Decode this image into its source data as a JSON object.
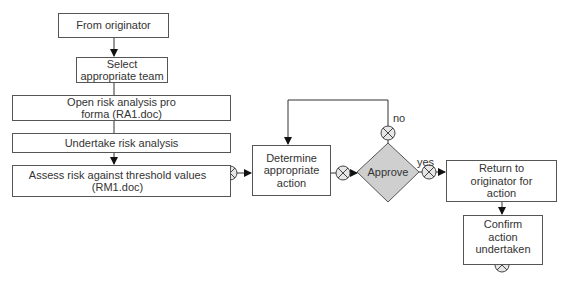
{
  "nodes": {
    "from_originator": "From originator",
    "select_team": "Select appropriate team",
    "open_risk": "Open risk analysis pro forma (RA1.doc)",
    "undertake": "Undertake risk analysis",
    "assess": "Assess risk against threshold values (RM1.doc)",
    "determine": "Determine appropriate action",
    "approve": "Approve",
    "return": "Return to originator for action",
    "confirm": "Confirm action undertaken"
  },
  "labels": {
    "no": "no",
    "yes": "yes"
  },
  "colors": {
    "line": "#333333",
    "box_border": "#555555",
    "diamond_fill": "#cfcfcf",
    "gateway_fill": "#e6e6e6"
  }
}
